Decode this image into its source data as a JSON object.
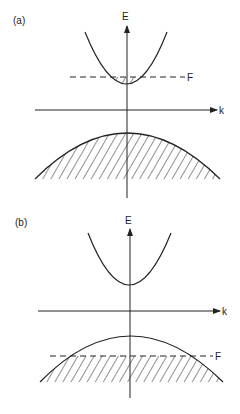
{
  "panels": [
    {
      "id": "a",
      "label": "(a)",
      "energy_axis_label": "E",
      "wavevector_axis_label": "k",
      "fermi_label": "F",
      "description": "Fermi level lies inside the conduction band; a small occupied (hatched) region at the bottom of the conduction band; valence band fully hatched (filled)."
    },
    {
      "id": "b",
      "label": "(b)",
      "energy_axis_label": "E",
      "wavevector_axis_label": "k",
      "fermi_label": "F",
      "description": "Fermi level lies inside the valence band; valence band hatched only below F; conduction band empty."
    }
  ],
  "colors": {
    "line": "#222222",
    "background": "#ffffff"
  }
}
